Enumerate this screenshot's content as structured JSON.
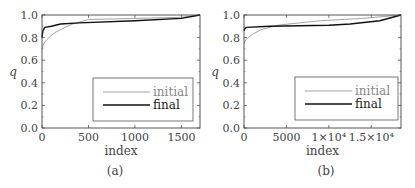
{
  "chart_data": [
    {
      "type": "line",
      "panel": "(a)",
      "xlabel": "index",
      "ylabel": "q",
      "xlim": [
        0,
        1700
      ],
      "ylim": [
        0.0,
        1.0
      ],
      "xticks": [
        0,
        500,
        1000,
        1500
      ],
      "xtick_labels": [
        "0",
        "500",
        "1000",
        "1500"
      ],
      "yticks": [
        0.0,
        0.2,
        0.4,
        0.6,
        0.8,
        1.0
      ],
      "ytick_labels": [
        "0.0",
        "0.2",
        "0.4",
        "0.6",
        "0.8",
        "1.0"
      ],
      "legend_position": "lower right",
      "grid": false,
      "series": [
        {
          "name": "initial",
          "color": "#999999",
          "x": [
            0,
            20,
            50,
            100,
            150,
            250,
            330,
            500,
            1000,
            1500,
            1700
          ],
          "y": [
            0.7,
            0.75,
            0.78,
            0.82,
            0.85,
            0.89,
            0.92,
            0.96,
            0.97,
            0.98,
            1.0
          ]
        },
        {
          "name": "final",
          "color": "#111111",
          "x": [
            0,
            10,
            30,
            100,
            200,
            400,
            1000,
            1500,
            1700
          ],
          "y": [
            0.8,
            0.86,
            0.89,
            0.9,
            0.92,
            0.93,
            0.95,
            0.97,
            1.0
          ]
        }
      ]
    },
    {
      "type": "line",
      "panel": "(b)",
      "xlabel": "index",
      "ylabel": "q",
      "xlim": [
        0,
        18500
      ],
      "ylim": [
        0.0,
        1.0
      ],
      "xticks": [
        0,
        5000,
        10000,
        15000
      ],
      "xtick_labels": [
        "0",
        "5000",
        "1×10⁴",
        "1.5×10⁴"
      ],
      "yticks": [
        0.0,
        0.2,
        0.4,
        0.6,
        0.8,
        1.0
      ],
      "ytick_labels": [
        "0.0",
        "0.2",
        "0.4",
        "0.6",
        "0.8",
        "1.0"
      ],
      "legend_position": "lower right",
      "grid": false,
      "series": [
        {
          "name": "initial",
          "color": "#999999",
          "x": [
            0,
            200,
            500,
            1000,
            2000,
            4000,
            9000,
            14000,
            17000,
            18500
          ],
          "y": [
            0.75,
            0.78,
            0.8,
            0.83,
            0.87,
            0.91,
            0.95,
            0.97,
            0.99,
            1.0
          ]
        },
        {
          "name": "final",
          "color": "#111111",
          "x": [
            0,
            100,
            300,
            3000,
            10000,
            12500,
            16000,
            18500
          ],
          "y": [
            0.86,
            0.88,
            0.89,
            0.9,
            0.91,
            0.92,
            0.95,
            1.0
          ]
        }
      ]
    }
  ],
  "panels": [
    {
      "caption": "(a)",
      "xlabel": "index",
      "ylabel": "q",
      "legend": {
        "initial": "initial",
        "final": "final"
      }
    },
    {
      "caption": "(b)",
      "xlabel": "index",
      "ylabel": "q",
      "legend": {
        "initial": "initial",
        "final": "final"
      }
    }
  ]
}
